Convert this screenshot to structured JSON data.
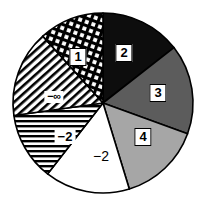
{
  "chart_data": {
    "type": "pie",
    "title": "",
    "subtitle": "",
    "xlabel": "",
    "ylabel": "",
    "legend_position": "none",
    "grid": false,
    "center": {
      "cx": 103,
      "cy": 103,
      "r": 90
    },
    "start_angle_deg": 0,
    "direction": "clockwise",
    "categories": [
      "2",
      "3",
      "4",
      "-2",
      "-2",
      "-∞",
      "1"
    ],
    "values": [
      14.4,
      16.1,
      14.7,
      15.3,
      12.2,
      15.6,
      11.7
    ],
    "slices": [
      {
        "label": "2",
        "start_deg": 0,
        "end_deg": 52,
        "sweep_deg": 52,
        "percent": 14.4,
        "fill": "#0d0d0d",
        "pattern": "solid",
        "label_style": "boxed",
        "label_x": 124,
        "label_y": 53
      },
      {
        "label": "3",
        "start_deg": 52,
        "end_deg": 110,
        "sweep_deg": 58,
        "percent": 16.1,
        "fill": "#5c5c5c",
        "pattern": "solid",
        "label_style": "boxed",
        "label_x": 158,
        "label_y": 93
      },
      {
        "label": "4",
        "start_deg": 110,
        "end_deg": 163,
        "sweep_deg": 53,
        "percent": 14.7,
        "fill": "#a6a6a6",
        "pattern": "solid",
        "label_style": "boxed",
        "label_x": 143,
        "label_y": 137
      },
      {
        "label": "−2",
        "start_deg": 163,
        "end_deg": 218,
        "sweep_deg": 55,
        "percent": 15.3,
        "fill": "#ffffff",
        "pattern": "solid",
        "label_style": "plain-onwhite",
        "label_x": 101,
        "label_y": 156
      },
      {
        "label": "−2",
        "start_deg": 218,
        "end_deg": 262,
        "sweep_deg": 44,
        "percent": 12.2,
        "fill": "#ffffff",
        "pattern": "horizontal-lines",
        "label_style": "hatch-bg",
        "label_x": 65,
        "label_y": 137
      },
      {
        "label": "−∞",
        "start_deg": 262,
        "end_deg": 318,
        "sweep_deg": 56,
        "percent": 15.6,
        "fill": "#ffffff",
        "pattern": "diagonal-lines",
        "label_style": "hatch-bg-tiny",
        "label_x": 54,
        "label_y": 97
      },
      {
        "label": "1",
        "start_deg": 318,
        "end_deg": 360,
        "sweep_deg": 42,
        "percent": 11.7,
        "fill": "#ffffff",
        "pattern": "cross-hatch",
        "label_style": "boxed",
        "label_x": 78,
        "label_y": 57
      }
    ],
    "colors": {
      "black": "#0d0d0d",
      "dark_gray": "#5c5c5c",
      "light_gray": "#a6a6a6",
      "white": "#ffffff",
      "outline": "#000000",
      "background": "#ffffff"
    }
  }
}
